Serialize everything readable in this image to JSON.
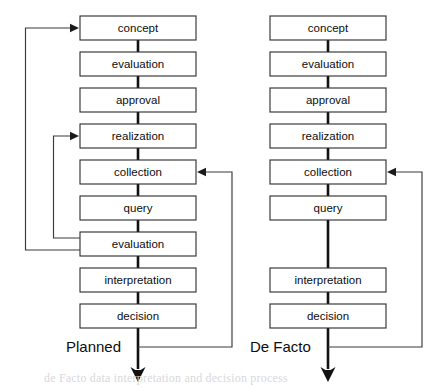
{
  "figure": {
    "columns": [
      {
        "id": "planned",
        "label": "Planned",
        "label_x": 66,
        "label_y": 348,
        "box_left": 80,
        "box_right": 196,
        "steps": [
          {
            "slot": 1,
            "label": "concept"
          },
          {
            "slot": 2,
            "label": "evaluation"
          },
          {
            "slot": 3,
            "label": "approval"
          },
          {
            "slot": 4,
            "label": "realization"
          },
          {
            "slot": 5,
            "label": "collection"
          },
          {
            "slot": 6,
            "label": "query"
          },
          {
            "slot": 7,
            "label": "evaluation"
          },
          {
            "slot": 8,
            "label": "interpretation"
          },
          {
            "slot": 9,
            "label": "decision"
          }
        ],
        "feedback_loops": [
          {
            "name": "evaluation-to-concept",
            "from_slot": 7,
            "to_slot": 1,
            "side": "left",
            "channel_x": 25.5,
            "exit_y": 250
          },
          {
            "name": "evaluation-to-realization",
            "from_slot": 7,
            "to_slot": 4,
            "side": "left",
            "channel_x": 53.5,
            "exit_y": 238
          },
          {
            "name": "output-to-collection",
            "from_slot": "output",
            "to_slot": 5,
            "side": "right",
            "channel_x": 232,
            "exit_y": 347
          }
        ]
      },
      {
        "id": "de-facto",
        "label": "De Facto",
        "label_x": 250,
        "label_y": 348,
        "box_left": 270,
        "box_right": 386,
        "steps": [
          {
            "slot": 1,
            "label": "concept"
          },
          {
            "slot": 2,
            "label": "evaluation"
          },
          {
            "slot": 3,
            "label": "approval"
          },
          {
            "slot": 4,
            "label": "realization"
          },
          {
            "slot": 5,
            "label": "collection"
          },
          {
            "slot": 6,
            "label": "query"
          },
          {
            "slot": 7,
            "label": ""
          },
          {
            "slot": 8,
            "label": "interpretation"
          },
          {
            "slot": 9,
            "label": "decision"
          }
        ],
        "feedback_loops": [
          {
            "name": "output-to-collection",
            "from_slot": "output",
            "to_slot": 5,
            "side": "right",
            "channel_x": 422,
            "exit_y": 347
          }
        ]
      }
    ],
    "geometry": {
      "first_box_top": 16,
      "row_pitch": 36,
      "box_height": 24,
      "output_arrow_tip_y": 382
    },
    "colors": {
      "background": "#ffffff",
      "box_fill": "#ffffff",
      "box_stroke": "#2b2b2b",
      "flow_line": "#111111",
      "loop_line": "#3a3a3a",
      "text": "#0d0d0d"
    },
    "caption": "de Facto data interpretation and decision process"
  }
}
